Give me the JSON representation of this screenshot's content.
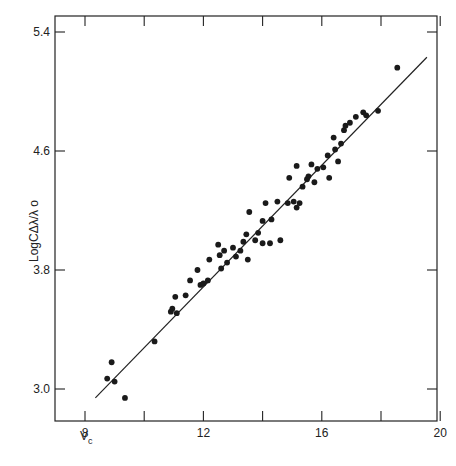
{
  "chart_data": {
    "type": "scatter",
    "title": "",
    "xlabel": "V_c",
    "ylabel": "Log(Δλ/λ₀)",
    "xlim": [
      7.4,
      20
    ],
    "ylim": [
      2.78,
      5.49
    ],
    "xticks": [
      8,
      10,
      12,
      14,
      16,
      18,
      20
    ],
    "xtick_labels": [
      "8",
      "",
      "12",
      "",
      "16",
      "",
      "20"
    ],
    "yticks": [
      3.0,
      3.8,
      4.6,
      5.4
    ],
    "ytick_labels": [
      "3.0",
      "3.8",
      "4.6",
      "5.4"
    ],
    "grid": false,
    "legend": null,
    "series": [
      {
        "name": "observations",
        "type": "scatter",
        "points": [
          [
            8.9,
            3.18
          ],
          [
            8.75,
            3.07
          ],
          [
            9.0,
            3.05
          ],
          [
            9.35,
            2.94
          ],
          [
            10.35,
            3.32
          ],
          [
            10.9,
            3.52
          ],
          [
            10.95,
            3.54
          ],
          [
            11.05,
            3.62
          ],
          [
            11.1,
            3.51
          ],
          [
            11.4,
            3.63
          ],
          [
            11.55,
            3.73
          ],
          [
            11.8,
            3.8
          ],
          [
            11.9,
            3.7
          ],
          [
            12.0,
            3.71
          ],
          [
            12.15,
            3.73
          ],
          [
            12.2,
            3.87
          ],
          [
            12.55,
            3.9
          ],
          [
            12.5,
            3.97
          ],
          [
            12.7,
            3.93
          ],
          [
            12.6,
            3.81
          ],
          [
            12.8,
            3.85
          ],
          [
            13.0,
            3.95
          ],
          [
            13.25,
            3.93
          ],
          [
            13.1,
            3.89
          ],
          [
            13.35,
            3.99
          ],
          [
            13.45,
            4.04
          ],
          [
            13.5,
            3.87
          ],
          [
            13.55,
            4.19
          ],
          [
            13.75,
            4.0
          ],
          [
            13.85,
            4.05
          ],
          [
            14.0,
            3.98
          ],
          [
            14.0,
            4.13
          ],
          [
            14.1,
            4.25
          ],
          [
            14.25,
            3.98
          ],
          [
            14.3,
            4.14
          ],
          [
            14.5,
            4.26
          ],
          [
            14.6,
            4.0
          ],
          [
            14.85,
            4.25
          ],
          [
            14.9,
            4.42
          ],
          [
            15.05,
            4.26
          ],
          [
            15.15,
            4.22
          ],
          [
            15.15,
            4.5
          ],
          [
            15.25,
            4.25
          ],
          [
            15.35,
            4.36
          ],
          [
            15.5,
            4.41
          ],
          [
            15.55,
            4.43
          ],
          [
            15.65,
            4.51
          ],
          [
            15.75,
            4.39
          ],
          [
            15.85,
            4.48
          ],
          [
            16.05,
            4.49
          ],
          [
            16.2,
            4.57
          ],
          [
            16.25,
            4.42
          ],
          [
            16.4,
            4.69
          ],
          [
            16.45,
            4.61
          ],
          [
            16.55,
            4.53
          ],
          [
            16.65,
            4.65
          ],
          [
            16.75,
            4.74
          ],
          [
            16.8,
            4.77
          ],
          [
            16.95,
            4.79
          ],
          [
            17.15,
            4.83
          ],
          [
            17.4,
            4.86
          ],
          [
            17.5,
            4.84
          ],
          [
            17.9,
            4.87
          ],
          [
            18.55,
            5.16
          ]
        ]
      },
      {
        "name": "fit",
        "type": "line",
        "points": [
          [
            8.35,
            2.94
          ],
          [
            19.55,
            5.23
          ]
        ]
      }
    ]
  },
  "labels": {
    "x_axis": "V",
    "x_axis_sub": "c",
    "y_axis": "LogCΔλ/λ o"
  },
  "style": {
    "ink": "#222222",
    "dot": "#1a1a1a",
    "background": "#ffffff"
  }
}
